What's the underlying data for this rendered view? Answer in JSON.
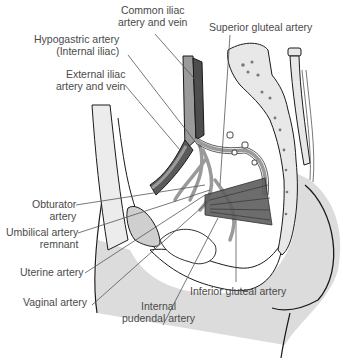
{
  "diagram": {
    "labels": {
      "common_iliac": "Common iliac\nartery and vein",
      "superior_gluteal": "Superior gluteal artery",
      "hypogastric": "Hypogastric artery\n(Internal iliac)",
      "external_iliac": "External iliac\nartery and vein",
      "obturator": "Obturator\nartery",
      "umbilical": "Umbilical artery\nremnant",
      "uterine": "Uterine artery",
      "vaginal": "Vaginal artery",
      "internal_pudendal": "Internal\npudendal artery",
      "inferior_gluteal": "Inferior gluteal artery"
    },
    "colors": {
      "artery": "#9a9a9a",
      "vein": "#4d4d4d",
      "bone": "#e6e6e6",
      "soft_tissue": "#dcdcdc",
      "outline": "#1a1a1a",
      "leader": "#555555",
      "text": "#4a4a4a"
    }
  }
}
